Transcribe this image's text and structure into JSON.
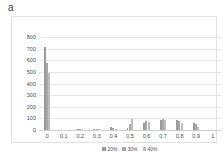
{
  "panel": {
    "label": "a"
  },
  "chart_data": {
    "type": "bar",
    "title": "",
    "subtitle": "",
    "xlabel": "",
    "ylabel": "",
    "grid": true,
    "legend_position": "bottom",
    "xlim": [
      -0.05,
      1.05
    ],
    "ylim": [
      0,
      800
    ],
    "yticks": [
      0,
      100,
      200,
      300,
      400,
      500,
      600,
      700,
      800
    ],
    "ytick_labels": [
      "0",
      "100",
      "200",
      "300",
      "400",
      "500",
      "600",
      "700",
      "800"
    ],
    "xticks": [
      0,
      0.1,
      0.2,
      0.3,
      0.4,
      0.5,
      0.6,
      0.7,
      0.8,
      0.9,
      1
    ],
    "xtick_labels": [
      "0",
      "0.1",
      "0.2",
      "0.3",
      "0.4",
      "0.5",
      "0.6",
      "0.7",
      "0.8",
      "0.9",
      "1"
    ],
    "categories": [
      0,
      0.1,
      0.2,
      0.3,
      0.4,
      0.5,
      0.6,
      0.7,
      0.8,
      0.9,
      1
    ],
    "series": [
      {
        "name": "20%",
        "color": "#9a9a9a",
        "values": [
          710,
          0,
          8,
          10,
          28,
          20,
          62,
          85,
          88,
          60,
          0
        ]
      },
      {
        "name": "30%",
        "color": "#a8a8a8",
        "values": [
          580,
          0,
          6,
          9,
          18,
          48,
          78,
          92,
          80,
          48,
          0
        ]
      },
      {
        "name": "40%",
        "color": "#bdbdbd",
        "values": [
          490,
          0,
          5,
          7,
          12,
          95,
          72,
          88,
          62,
          22,
          0
        ]
      }
    ]
  }
}
